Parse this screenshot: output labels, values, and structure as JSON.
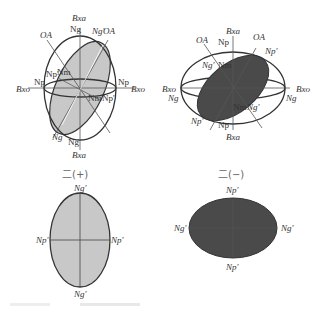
{
  "figure": {
    "colors": {
      "line": "#333333",
      "positive_fill": "#c8c8c8",
      "negative_fill": "#4a4a4a",
      "background": "#ffffff"
    },
    "top_left": {
      "labels": {
        "bxa_top": "Bxa",
        "bxa_bottom": "Bxa",
        "bxo_left": "Bxo",
        "bxo_right": "Bxo",
        "oa_left": "OA",
        "oa_right": "OA",
        "ng_top": "Ng",
        "ng_prime_top": "Ng'",
        "np_left": "Np",
        "np_right": "Np",
        "np_prime_left": "Np'",
        "nm_left": "Nm",
        "nm_right": "Nm",
        "np_prime_right": "Np'",
        "ng_prime_bottom": "Ng'",
        "ng_bottom": "Ng"
      }
    },
    "top_right": {
      "labels": {
        "bxa_top": "Bxa",
        "bxa_bottom": "Bxa",
        "bxo_left": "Bxo",
        "bxo_right": "Bxo",
        "oa_left": "OA",
        "oa_right": "OA",
        "np_top": "Np",
        "np_prime_top": "Np'",
        "ng_prime_left": "Ng'",
        "nm_top": "Nm",
        "ng_left": "Ng",
        "ng_right": "Ng",
        "nm_bottom": "Nm",
        "ng_prime_right": "Ng'",
        "np_prime_bottom": "Np'",
        "np_bottom": "Np"
      }
    },
    "bottom_left": {
      "title": "二(+)",
      "labels": {
        "top": "Ng'",
        "bottom": "Ng'",
        "left": "Np'",
        "right": "Np'"
      }
    },
    "bottom_right": {
      "title": "二(−)",
      "labels": {
        "top": "Np'",
        "bottom": "Np'",
        "left": "Ng'",
        "right": "Ng'"
      }
    }
  }
}
